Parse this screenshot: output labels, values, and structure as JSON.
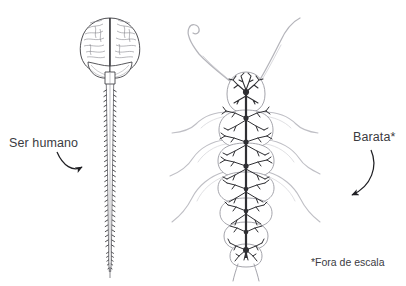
{
  "figure": {
    "type": "scientific-comparison-diagram",
    "background_color": "#ffffff",
    "ink_color_dark": "#2f2f33",
    "ink_color_light": "#b9b9be",
    "text_color": "#3b3b3f"
  },
  "labels": {
    "human": "Ser humano",
    "roach": "Barata*",
    "footnote": "*Fora de escala"
  },
  "specimens": {
    "human": {
      "name": "Ser humano",
      "parts": [
        "cérebro",
        "cerebelo",
        "tronco encefálico",
        "medula espinhal",
        "nervos espinhais",
        "cauda equina"
      ],
      "view": "posterior"
    },
    "roach": {
      "name": "Barata",
      "parts": [
        "antenas",
        "gânglio cerebral",
        "cordão nervoso ventral",
        "gânglios segmentares",
        "nervos periféricos",
        "pernas",
        "cercos"
      ],
      "view": "dorsal",
      "leg_pairs": 3,
      "abdominal_segments": 7
    }
  },
  "arrows": {
    "human_arrow": "curved-arrow-right",
    "roach_arrow": "curved-arrow-down-left"
  }
}
